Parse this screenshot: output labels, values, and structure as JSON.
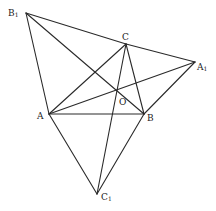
{
  "figure": {
    "points": {
      "B1": {
        "x": 26,
        "y": 13
      },
      "C": {
        "x": 126,
        "y": 44
      },
      "A1": {
        "x": 195,
        "y": 62
      },
      "A": {
        "x": 49,
        "y": 114
      },
      "B": {
        "x": 144,
        "y": 114
      },
      "C1": {
        "x": 97,
        "y": 194
      },
      "O": {
        "x": 117,
        "y": 90
      }
    },
    "segments": [
      [
        "B1",
        "C"
      ],
      [
        "C",
        "A1"
      ],
      [
        "B1",
        "A"
      ],
      [
        "B1",
        "B"
      ],
      [
        "A",
        "C"
      ],
      [
        "B",
        "C"
      ],
      [
        "A",
        "A1"
      ],
      [
        "B",
        "A1"
      ],
      [
        "A",
        "B"
      ],
      [
        "A",
        "C1"
      ],
      [
        "B",
        "C1"
      ],
      [
        "C",
        "C1"
      ]
    ],
    "labels": {
      "B1": {
        "main": "B",
        "sub": "1",
        "x": 8,
        "y": 9
      },
      "C": {
        "main": "C",
        "sub": "",
        "x": 122,
        "y": 33
      },
      "A1": {
        "main": "A",
        "sub": "1",
        "x": 197,
        "y": 63
      },
      "A": {
        "main": "A",
        "sub": "",
        "x": 37,
        "y": 112
      },
      "B": {
        "main": "B",
        "sub": "",
        "x": 147,
        "y": 114
      },
      "O": {
        "main": "O",
        "sub": "",
        "x": 119,
        "y": 98
      },
      "C1": {
        "main": "C",
        "sub": "1",
        "x": 101,
        "y": 193
      }
    },
    "stroke_color": "#2a2a2a"
  }
}
